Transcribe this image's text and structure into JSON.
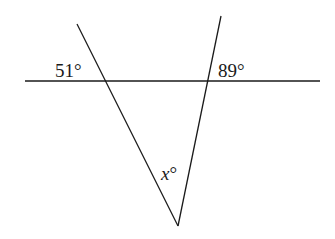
{
  "diagram": {
    "type": "geometry-angles",
    "labels": {
      "left_angle": "51°",
      "right_angle": "89°",
      "bottom_angle": "x°"
    },
    "line_color": "#1a1a1a",
    "background": "#ffffff"
  }
}
